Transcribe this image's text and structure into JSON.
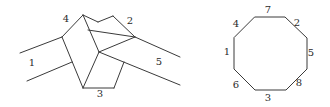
{
  "knot_diagram": {
    "labels": [
      {
        "id": "l1",
        "text": "1",
        "x": 32,
        "y": 66
      },
      {
        "id": "l2",
        "text": "2",
        "x": 130,
        "y": 24
      },
      {
        "id": "l3",
        "text": "3",
        "x": 100,
        "y": 97
      },
      {
        "id": "l4",
        "text": "4",
        "x": 66,
        "y": 22
      },
      {
        "id": "l5",
        "text": "5",
        "x": 159,
        "y": 65
      }
    ],
    "segments": [
      [
        20,
        53,
        62,
        37
      ],
      [
        27,
        81,
        72,
        62
      ],
      [
        62,
        37,
        83,
        15
      ],
      [
        62,
        37,
        83,
        88
      ],
      [
        83,
        15,
        99,
        52
      ],
      [
        83,
        88,
        99,
        52
      ],
      [
        83,
        15,
        98,
        22
      ],
      [
        98,
        22,
        113,
        16
      ],
      [
        113,
        16,
        135,
        37
      ],
      [
        88,
        30,
        135,
        37
      ],
      [
        99,
        52,
        135,
        37
      ],
      [
        135,
        37,
        180,
        57
      ],
      [
        99,
        52,
        180,
        85
      ],
      [
        83,
        88,
        114,
        88
      ],
      [
        114,
        88,
        124,
        62
      ]
    ]
  },
  "octagon": {
    "vertices": [
      [
        255,
        17
      ],
      [
        285,
        17
      ],
      [
        307,
        38
      ],
      [
        307,
        69
      ],
      [
        286,
        90
      ],
      [
        255,
        90
      ],
      [
        234,
        69
      ],
      [
        234,
        38
      ]
    ],
    "labels": [
      {
        "id": "o7",
        "text": "7",
        "x": 268,
        "y": 13
      },
      {
        "id": "o2",
        "text": "2",
        "x": 297,
        "y": 26
      },
      {
        "id": "o5",
        "text": "5",
        "x": 311,
        "y": 56
      },
      {
        "id": "o8",
        "text": "8",
        "x": 299,
        "y": 86
      },
      {
        "id": "o3",
        "text": "3",
        "x": 268,
        "y": 101
      },
      {
        "id": "o6",
        "text": "6",
        "x": 236,
        "y": 88
      },
      {
        "id": "o1",
        "text": "1",
        "x": 227,
        "y": 55
      },
      {
        "id": "o4",
        "text": "4",
        "x": 236,
        "y": 27
      }
    ]
  }
}
